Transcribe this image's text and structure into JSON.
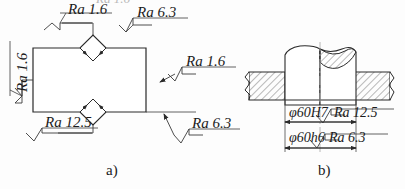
{
  "figure": {
    "title_cut_off_top": "Ra 1.6",
    "sub_labels": {
      "left": "a)",
      "right": "b)"
    }
  },
  "part_a": {
    "name": "notched-plate-view",
    "annotations": [
      {
        "id": "a-top-left",
        "text": "Ra 1.6",
        "orientation": "horizontal"
      },
      {
        "id": "a-left",
        "text": "Ra 1.6",
        "orientation": "vertical"
      },
      {
        "id": "a-top-right",
        "text": "Ra 6.3",
        "orientation": "horizontal"
      },
      {
        "id": "a-right",
        "text": "Ra 1.6",
        "orientation": "horizontal"
      },
      {
        "id": "a-bottom-left",
        "text": "Ra 12.5",
        "orientation": "horizontal"
      },
      {
        "id": "a-bottom-right",
        "text": "Ra 6.3",
        "orientation": "horizontal"
      }
    ]
  },
  "part_b": {
    "name": "shaft-hole-section-view",
    "dimensions": [
      {
        "id": "b-dim-hole",
        "text": "φ60H7",
        "finish": "Ra 12.5"
      },
      {
        "id": "b-dim-shaft",
        "text": "φ60h6",
        "finish": "Ra 6.3"
      }
    ]
  },
  "colors": {
    "line": "#2a2a2a",
    "thin_line": "#555555",
    "center_line": "#b0b0b0",
    "text": "#1b1b1b",
    "background": "#fdfdfd"
  }
}
